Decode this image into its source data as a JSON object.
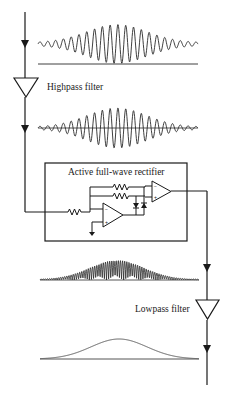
{
  "diagram": {
    "type": "signal-processing-block-diagram",
    "stages": [
      {
        "id": "input",
        "label": "",
        "signal": "raw noisy burst (AC, with slow drift baseline)"
      },
      {
        "id": "highpass",
        "label": "Highpass filter",
        "signal": "zero-centered burst"
      },
      {
        "id": "rectifier",
        "label": "Active full-wave rectifier",
        "signal": "rectified burst (positive only)"
      },
      {
        "id": "lowpass",
        "label": "Lowpass filter",
        "signal": "smooth envelope"
      }
    ],
    "labels": {
      "highpass": "Highpass filter",
      "rectifier": "Active full-wave rectifier",
      "lowpass": "Lowpass filter"
    },
    "colors": {
      "stroke": "#1a1a1a",
      "waveform": "#2a2a2a",
      "envelope": "#555555",
      "background": "#ffffff"
    }
  }
}
